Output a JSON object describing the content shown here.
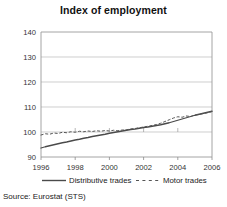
{
  "chart_data": {
    "type": "line",
    "title": "Index of employment",
    "xlabel": "",
    "ylabel": "",
    "xlim": [
      1996,
      2006
    ],
    "ylim": [
      90,
      140
    ],
    "ytick_labels": [
      "90",
      "100",
      "110",
      "120",
      "130",
      "140"
    ],
    "ytick_values": [
      90,
      100,
      110,
      120,
      130,
      140
    ],
    "xtick_labels": [
      "1996",
      "1998",
      "2000",
      "2002",
      "2004",
      "2006"
    ],
    "xtick_values": [
      1996,
      1998,
      2000,
      2002,
      2004,
      2006
    ],
    "grid": "horizontal",
    "legend_position": "below",
    "x": [
      1996,
      1996.25,
      1996.5,
      1996.75,
      1997,
      1997.25,
      1997.5,
      1997.75,
      1998,
      1998.25,
      1998.5,
      1998.75,
      1999,
      1999.25,
      1999.5,
      1999.75,
      2000,
      2000.25,
      2000.5,
      2000.75,
      2001,
      2001.25,
      2001.5,
      2001.75,
      2002,
      2002.25,
      2002.5,
      2002.75,
      2003,
      2003.25,
      2003.5,
      2003.75,
      2004,
      2004.25,
      2004.5,
      2004.75,
      2005,
      2005.25,
      2005.5,
      2005.75,
      2006
    ],
    "series": [
      {
        "name": "Distributive trades",
        "style": "solid",
        "color": "#4a4a4a",
        "values": [
          93.6,
          94.1,
          94.5,
          94.9,
          95.3,
          95.7,
          96.0,
          96.4,
          96.8,
          97.1,
          97.5,
          97.8,
          98.2,
          98.5,
          98.8,
          99.1,
          99.5,
          99.8,
          100.1,
          100.4,
          100.7,
          101.0,
          101.2,
          101.5,
          101.8,
          102.0,
          102.3,
          102.6,
          102.9,
          103.3,
          103.7,
          104.2,
          104.7,
          105.2,
          105.7,
          106.2,
          106.7,
          107.1,
          107.5,
          107.9,
          108.3
        ]
      },
      {
        "name": "Motor trades",
        "style": "dashed",
        "color": "#555555",
        "values": [
          98.8,
          99.3,
          99.1,
          99.6,
          99.4,
          99.9,
          99.7,
          100.1,
          99.9,
          100.3,
          100.1,
          100.4,
          100.2,
          100.5,
          100.3,
          100.6,
          100.4,
          100.7,
          100.5,
          100.8,
          100.9,
          101.2,
          101.4,
          101.7,
          102.0,
          102.3,
          102.6,
          103.0,
          103.5,
          104.2,
          104.9,
          105.6,
          106.1,
          105.9,
          106.4,
          106.2,
          106.8,
          107.0,
          107.4,
          107.7,
          108.2
        ]
      }
    ]
  },
  "legend": {
    "entries": [
      {
        "label": "Distributive trades",
        "style": "solid"
      },
      {
        "label": "Motor trades",
        "style": "dashed"
      }
    ]
  },
  "source": {
    "text": "Source: Eurostat (STS)"
  }
}
